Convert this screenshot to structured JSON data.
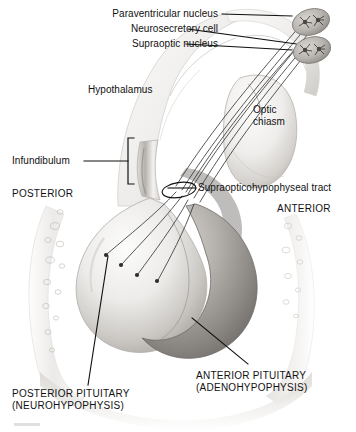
{
  "figure": {
    "style": "grayscale medical illustration",
    "colors": {
      "background": "#ffffff",
      "ink": "#111111",
      "tissue_light": "#f2f1ef",
      "tissue_mid": "#c9c7c4",
      "tissue_dark": "#8e8b88",
      "bone": "#e8e7e5",
      "leader_line": "#1a1a1a"
    }
  },
  "labels": {
    "paraventricular_nucleus": "Paraventricular nucleus",
    "neurosecretory_cell": "Neurosecretory cell",
    "supraoptic_nucleus": "Supraoptic nucleus",
    "hypothalamus": "Hypothalamus",
    "optic_chiasm": "Optic chiasm",
    "infundibulum": "Infundibulum",
    "supraopticohypophyseal_tract": "Supraopticohypophyseal tract",
    "posterior_direction": "POSTERIOR",
    "anterior_direction": "ANTERIOR",
    "posterior_pituitary": "POSTERIOR PITUITARY (NEUROHYPOPHYSIS)",
    "anterior_pituitary": "ANTERIOR PITUITARY (ADENOHYPOPHYSIS)"
  },
  "structures": [
    {
      "name": "paraventricular-nucleus",
      "description": "upper oval nucleus containing star-shaped neurosecretory cells"
    },
    {
      "name": "supraoptic-nucleus",
      "description": "lower oval nucleus containing star-shaped neurosecretory cells"
    },
    {
      "name": "hypothalamus",
      "description": "brain tissue above the infundibulum"
    },
    {
      "name": "optic-chiasm",
      "description": "teardrop-shaped body at right of the infundibulum"
    },
    {
      "name": "infundibulum",
      "description": "pituitary stalk marked by a square bracket"
    },
    {
      "name": "supraopticohypophyseal-tract",
      "description": "axon bundle encircled by a small ellipse"
    },
    {
      "name": "posterior-pituitary",
      "description": "lighter left lobe receiving axon terminals"
    },
    {
      "name": "anterior-pituitary",
      "description": "darker shaded right lobe"
    },
    {
      "name": "sella-turcica-bone",
      "description": "curved bone with trabecular bubble texture flanking the gland"
    }
  ],
  "counts": {
    "nuclei": 2,
    "axon_fibers_in_tract": 6,
    "axon_terminals_in_posterior_lobe": 4
  }
}
